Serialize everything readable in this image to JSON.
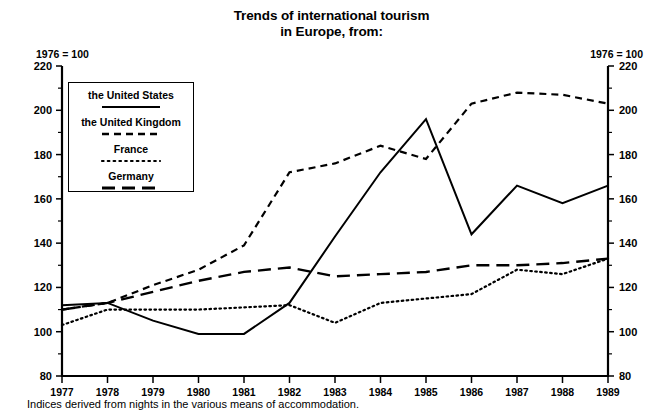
{
  "title": {
    "line1": "Trends of international tourism",
    "line2": "in Europe, from:"
  },
  "axis": {
    "unit_note_left": "1976 = 100",
    "unit_note_right": "1976 = 100"
  },
  "footnote": "Indices derived from nights in the various means of accommodation.",
  "legend": {
    "items": [
      {
        "label": "the United States",
        "style": "solid"
      },
      {
        "label": "the United Kingdom",
        "style": "short-dash"
      },
      {
        "label": "France",
        "style": "dotted"
      },
      {
        "label": "Germany",
        "style": "long-dash"
      }
    ]
  },
  "chart_data": {
    "type": "line",
    "title": "Trends of international tourism in Europe, from:",
    "subtitle": "1976 = 100",
    "xlabel": "",
    "ylabel": "1976 = 100",
    "x": [
      1977,
      1978,
      1979,
      1980,
      1981,
      1982,
      1983,
      1984,
      1985,
      1986,
      1987,
      1988,
      1989
    ],
    "categories": [
      "1977",
      "1978",
      "1979",
      "1980",
      "1981",
      "1982",
      "1983",
      "1984",
      "1985",
      "1986",
      "1987",
      "1988",
      "1989"
    ],
    "xlim": [
      1977,
      1989
    ],
    "ylim": [
      80,
      220
    ],
    "ytick_labels": [
      "80",
      "100",
      "120",
      "140",
      "160",
      "180",
      "200",
      "220"
    ],
    "ytick_values": [
      80,
      100,
      120,
      140,
      160,
      180,
      200,
      220
    ],
    "yminor_step": 10,
    "grid": false,
    "legend_position": "upper-left-inset",
    "series": [
      {
        "name": "the United States",
        "style": "solid",
        "values": [
          112,
          113,
          105,
          99,
          99,
          113,
          143,
          172,
          196,
          144,
          166,
          158,
          166
        ]
      },
      {
        "name": "the United Kingdom",
        "style": "short-dash",
        "values": [
          110,
          113,
          121,
          128,
          139,
          172,
          176,
          184,
          178,
          203,
          208,
          207,
          203
        ]
      },
      {
        "name": "France",
        "style": "dotted",
        "values": [
          103,
          110,
          110,
          110,
          111,
          112,
          104,
          113,
          115,
          117,
          128,
          126,
          133
        ]
      },
      {
        "name": "Germany",
        "style": "long-dash",
        "values": [
          110,
          113,
          118,
          123,
          127,
          129,
          125,
          126,
          127,
          130,
          130,
          131,
          133
        ]
      }
    ]
  }
}
